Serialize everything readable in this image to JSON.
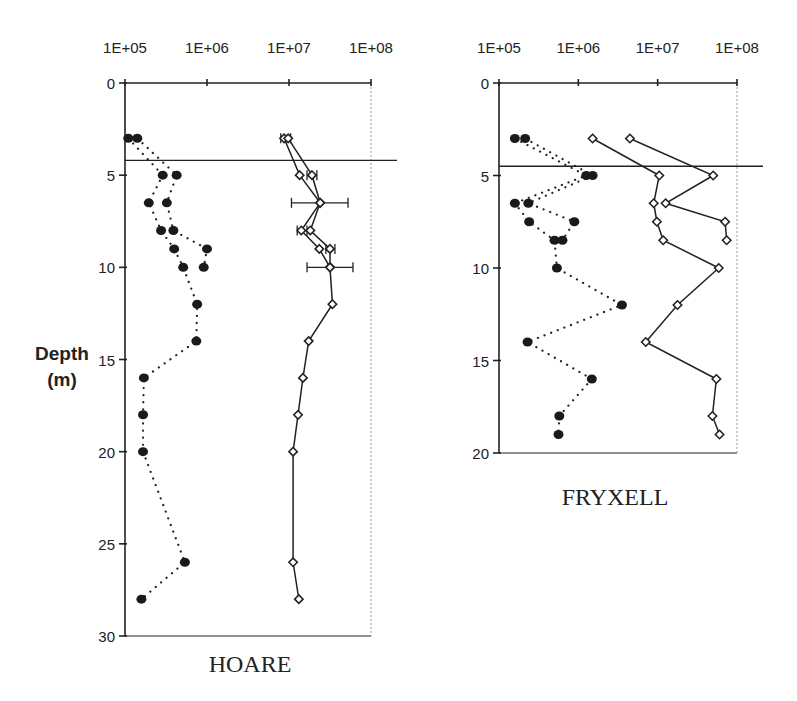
{
  "figure": {
    "y_label_line1": "Depth",
    "y_label_line2": "(m)"
  },
  "chart_data": [
    {
      "type": "scatter",
      "title": "HOARE",
      "xlabel": "",
      "ylabel": "Depth (m)",
      "x_scale": "log",
      "x_ticks": [
        "1E+05",
        "1E+06",
        "1E+07",
        "1E+08"
      ],
      "xlim_log10": [
        5,
        8
      ],
      "y_ticks": [
        0,
        5,
        10,
        15,
        20,
        25,
        30
      ],
      "ylim": [
        0,
        30
      ],
      "y_inverted": true,
      "grid": false,
      "reference_line_depth": 4.2,
      "series": [
        {
          "name": "filled circles (dotted line) A",
          "marker": "filled-circle",
          "line": "dotted",
          "points": [
            [
              3,
              5.04
            ],
            [
              5,
              5.46
            ],
            [
              6.5,
              5.29
            ],
            [
              8,
              5.44
            ],
            [
              9,
              5.6
            ],
            [
              10,
              5.71
            ],
            [
              12,
              5.88
            ],
            [
              14,
              5.87
            ],
            [
              16,
              5.23
            ],
            [
              18,
              5.22
            ],
            [
              20,
              5.22
            ],
            [
              26,
              5.73
            ],
            [
              28,
              5.2
            ]
          ]
        },
        {
          "name": "filled circles (dotted line) B",
          "marker": "filled-circle",
          "line": "dotted",
          "points": [
            [
              3,
              5.15
            ],
            [
              5,
              5.63
            ],
            [
              6.5,
              5.51
            ],
            [
              8,
              5.59
            ],
            [
              9,
              6.0
            ],
            [
              10,
              5.96
            ]
          ]
        },
        {
          "name": "open diamonds (solid line) A",
          "marker": "open-diamond",
          "line": "solid",
          "points": [
            [
              3,
              6.94
            ],
            [
              5,
              7.13
            ],
            [
              6.5,
              7.38
            ],
            [
              8,
              7.15
            ],
            [
              9,
              7.37
            ],
            [
              10,
              7.5
            ],
            [
              12,
              7.53
            ],
            [
              14,
              7.24
            ],
            [
              16,
              7.17
            ],
            [
              18,
              7.11
            ],
            [
              20,
              7.05
            ],
            [
              26,
              7.05
            ],
            [
              28,
              7.12
            ]
          ]
        },
        {
          "name": "open diamonds (solid line) B",
          "marker": "open-diamond",
          "line": "solid",
          "points": [
            [
              3,
              6.99
            ],
            [
              5,
              7.28
            ],
            [
              6.5,
              7.38
            ],
            [
              8,
              7.26
            ],
            [
              9,
              7.5
            ],
            [
              10,
              7.5
            ]
          ]
        }
      ],
      "error_bars": [
        {
          "depth": 3,
          "x_log10": [
            6.9,
            7.02
          ]
        },
        {
          "depth": 5,
          "x_log10": [
            7.22,
            7.34
          ]
        },
        {
          "depth": 6.5,
          "x_log10": [
            7.03,
            7.72
          ]
        },
        {
          "depth": 8,
          "x_log10": [
            7.1,
            7.22
          ]
        },
        {
          "depth": 9,
          "x_log10": [
            7.45,
            7.56
          ]
        },
        {
          "depth": 10,
          "x_log10": [
            7.22,
            7.78
          ]
        }
      ]
    },
    {
      "type": "scatter",
      "title": "FRYXELL",
      "xlabel": "",
      "ylabel": "Depth (m)",
      "x_scale": "log",
      "x_ticks": [
        "1E+05",
        "1E+06",
        "1E+07",
        "1E+08"
      ],
      "xlim_log10": [
        5,
        8
      ],
      "y_ticks": [
        0,
        5,
        10,
        15,
        20
      ],
      "ylim": [
        0,
        20
      ],
      "y_inverted": true,
      "grid": false,
      "reference_line_depth": 4.5,
      "series": [
        {
          "name": "filled circles (dotted line) A",
          "marker": "filled-circle",
          "line": "dotted",
          "points": [
            [
              3,
              5.2
            ],
            [
              5,
              6.1
            ],
            [
              6.5,
              5.2
            ],
            [
              7.5,
              5.38
            ],
            [
              8.5,
              5.7
            ],
            [
              10,
              5.73
            ],
            [
              12,
              6.55
            ],
            [
              14,
              5.36
            ],
            [
              16,
              6.17
            ],
            [
              18,
              5.76
            ],
            [
              19,
              5.75
            ]
          ]
        },
        {
          "name": "filled circles (dotted line) B",
          "marker": "filled-circle",
          "line": "dotted",
          "points": [
            [
              3,
              5.33
            ],
            [
              5,
              6.18
            ],
            [
              6.5,
              5.37
            ],
            [
              7.5,
              5.95
            ],
            [
              8.5,
              5.8
            ]
          ]
        },
        {
          "name": "open diamonds (solid line) A",
          "marker": "open-diamond",
          "line": "solid",
          "points": [
            [
              3,
              6.18
            ],
            [
              5,
              7.02
            ],
            [
              6.5,
              6.95
            ],
            [
              7.5,
              6.99
            ],
            [
              8.5,
              7.07
            ],
            [
              10,
              7.77
            ],
            [
              12,
              7.25
            ],
            [
              14,
              6.85
            ],
            [
              16,
              7.74
            ],
            [
              18,
              7.69
            ],
            [
              19,
              7.78
            ]
          ]
        },
        {
          "name": "open diamonds (solid line) B",
          "marker": "open-diamond",
          "line": "solid",
          "points": [
            [
              3,
              6.65
            ],
            [
              5,
              7.7
            ],
            [
              6.5,
              7.1
            ],
            [
              7.5,
              7.85
            ],
            [
              8.5,
              7.87
            ]
          ]
        }
      ]
    }
  ]
}
